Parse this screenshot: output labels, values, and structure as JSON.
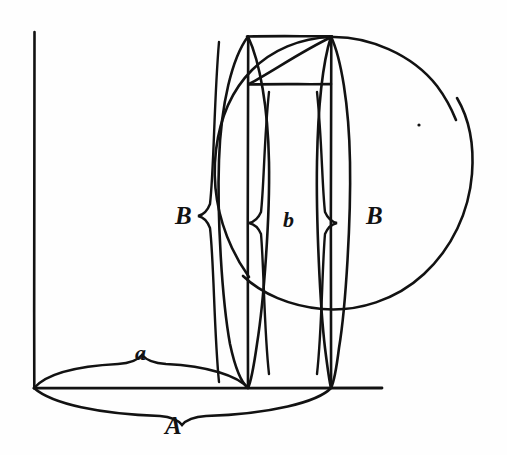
{
  "figure": {
    "style": "antique line engraving",
    "background_color": "#fefefe",
    "ink_color": "#121212",
    "labels": [
      {
        "id": "label-B-left",
        "text": "B",
        "x": 175,
        "y": 203,
        "size": "cap"
      },
      {
        "id": "label-b-mid",
        "text": "b",
        "x": 283,
        "y": 209,
        "size": "low"
      },
      {
        "id": "label-B-right",
        "text": "B",
        "x": 366,
        "y": 203,
        "size": "cap"
      },
      {
        "id": "label-a-small",
        "text": "a",
        "x": 135,
        "y": 342,
        "size": "low"
      },
      {
        "id": "label-A-large",
        "text": "A",
        "x": 165,
        "y": 413,
        "size": "cap"
      }
    ],
    "axes": {
      "vertical_axis": {
        "x": 34,
        "y_top": 32,
        "y_bottom": 388
      },
      "horizontal_axis": {
        "y": 388,
        "x_left": 34,
        "x_right": 382
      }
    },
    "circle": {
      "center_x": 340,
      "center_y": 170,
      "radius": 133,
      "arc_gaps": [
        "upper-right small gap"
      ]
    },
    "rectangle": {
      "left": 248,
      "right": 331,
      "top": 36,
      "bottom": 388,
      "inner_horizontal_line_y": 84,
      "diagonal": "from (248,84) to (331,36)"
    },
    "lenses": [
      {
        "id": "lens-left",
        "cx": 248,
        "top_y": 36,
        "bottom_y": 388,
        "half_width": 30
      },
      {
        "id": "lens-right",
        "cx": 331,
        "top_y": 36,
        "bottom_y": 388,
        "half_width": 19
      }
    ],
    "braces": [
      {
        "id": "brace-B-left",
        "orientation": "vertical",
        "label": "B",
        "from": 218,
        "to": 248
      },
      {
        "id": "brace-b-mid",
        "orientation": "vertical",
        "label": "b",
        "from": 248,
        "to": 331
      },
      {
        "id": "brace-B-right",
        "orientation": "vertical",
        "label": "B",
        "from": 331,
        "to": 350
      },
      {
        "id": "brace-a-small",
        "orientation": "horizontal",
        "label": "a",
        "from": 34,
        "to": 248
      },
      {
        "id": "brace-A-large",
        "orientation": "horizontal",
        "label": "A",
        "from": 34,
        "to": 331
      }
    ],
    "center_dot": {
      "x": 419,
      "y": 125,
      "radius": 1.6
    }
  }
}
